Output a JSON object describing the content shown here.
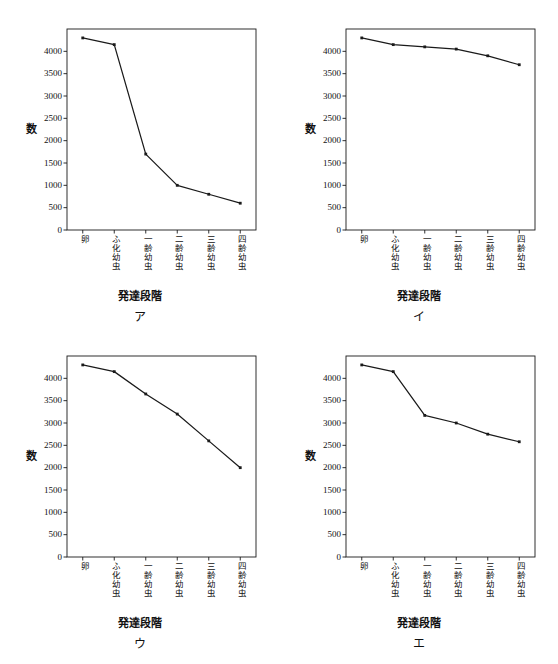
{
  "figure": {
    "panel_count": 4,
    "axis_color": "#1a1a1a",
    "line_color": "#1a1a1a",
    "background": "#ffffff"
  },
  "axis": {
    "y_title": "数",
    "x_title": "発達段階",
    "y_ticks": [
      "0",
      "500",
      "1000",
      "1500",
      "2000",
      "2500",
      "3000",
      "3500",
      "4000"
    ],
    "y_tick_values": [
      0,
      500,
      1000,
      1500,
      2000,
      2500,
      3000,
      3500,
      4000
    ],
    "x_categories": [
      "卵",
      "ふ化幼虫",
      "一齢幼虫",
      "二齢幼虫",
      "三齢幼虫",
      "四齢幼虫"
    ],
    "ylim": [
      0,
      4500
    ],
    "grid": false,
    "legend": "none"
  },
  "panels": [
    {
      "key": "a",
      "label": "ア"
    },
    {
      "key": "b",
      "label": "イ"
    },
    {
      "key": "c",
      "label": "ウ"
    },
    {
      "key": "d",
      "label": "エ"
    }
  ],
  "chart_data": [
    {
      "type": "line",
      "panel": "ア",
      "title": "",
      "xlabel": "発達段階",
      "ylabel": "数",
      "categories": [
        "卵",
        "ふ化幼虫",
        "一齢幼虫",
        "二齢幼虫",
        "三齢幼虫",
        "四齢幼虫"
      ],
      "values": [
        4300,
        4150,
        1700,
        1000,
        800,
        600
      ],
      "ylim": [
        0,
        4500
      ],
      "yticks": [
        0,
        500,
        1000,
        1500,
        2000,
        2500,
        3000,
        3500,
        4000
      ],
      "grid": false,
      "markers": true
    },
    {
      "type": "line",
      "panel": "イ",
      "title": "",
      "xlabel": "発達段階",
      "ylabel": "数",
      "categories": [
        "卵",
        "ふ化幼虫",
        "一齢幼虫",
        "二齢幼虫",
        "三齢幼虫",
        "四齢幼虫"
      ],
      "values": [
        4300,
        4150,
        4100,
        4050,
        3900,
        3700
      ],
      "ylim": [
        0,
        4500
      ],
      "yticks": [
        0,
        500,
        1000,
        1500,
        2000,
        2500,
        3000,
        3500,
        4000
      ],
      "grid": false,
      "markers": true
    },
    {
      "type": "line",
      "panel": "ウ",
      "title": "",
      "xlabel": "発達段階",
      "ylabel": "数",
      "categories": [
        "卵",
        "ふ化幼虫",
        "一齢幼虫",
        "二齢幼虫",
        "三齢幼虫",
        "四齢幼虫"
      ],
      "values": [
        4300,
        4150,
        3650,
        3200,
        2600,
        2000
      ],
      "ylim": [
        0,
        4500
      ],
      "yticks": [
        0,
        500,
        1000,
        1500,
        2000,
        2500,
        3000,
        3500,
        4000
      ],
      "grid": false,
      "markers": true
    },
    {
      "type": "line",
      "panel": "エ",
      "title": "",
      "xlabel": "発達段階",
      "ylabel": "数",
      "categories": [
        "卵",
        "ふ化幼虫",
        "一齢幼虫",
        "二齢幼虫",
        "三齢幼虫",
        "四齢幼虫"
      ],
      "values": [
        4300,
        4150,
        3170,
        3000,
        2750,
        2580
      ],
      "ylim": [
        0,
        4500
      ],
      "yticks": [
        0,
        500,
        1000,
        1500,
        2000,
        2500,
        3000,
        3500,
        4000
      ],
      "grid": false,
      "markers": true
    }
  ]
}
